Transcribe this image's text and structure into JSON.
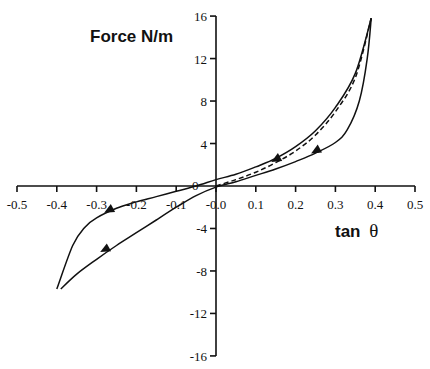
{
  "chart_data": {
    "type": "line",
    "title": "",
    "xlabel": "tan θ",
    "xlabel_parts": {
      "text": "tan",
      "symbol": "θ"
    },
    "ylabel": "Force N/m",
    "xlim": [
      -0.5,
      0.5
    ],
    "ylim": [
      -16,
      16
    ],
    "grid": false,
    "legend": null,
    "x_ticks": [
      -0.5,
      -0.4,
      -0.3,
      -0.2,
      -0.1,
      0.0,
      0.1,
      0.2,
      0.3,
      0.4,
      0.5
    ],
    "x_tick_labels": [
      "-0.5",
      "-0.4",
      "-0.3",
      "-0.2",
      "-0.1",
      "-0.0",
      "0.1",
      "0.2",
      "0.3",
      "0.4",
      "0.5"
    ],
    "y_ticks": [
      16,
      12,
      8,
      4,
      0,
      -4,
      -8,
      -12,
      -16
    ],
    "y_tick_labels": [
      "16",
      "12",
      "8",
      "4",
      "0",
      "-4",
      "-8",
      "-12",
      "-16"
    ],
    "series": [
      {
        "name": "loading (upper branch, solid)",
        "style": "solid",
        "direction_arrow": "down-left along branch toward origin",
        "x": [
          -0.4,
          -0.36,
          -0.33,
          -0.3,
          -0.25,
          -0.2,
          -0.15,
          -0.1,
          -0.05,
          0.0,
          0.05,
          0.1,
          0.15,
          0.2,
          0.25,
          0.3,
          0.35,
          0.39
        ],
        "y": [
          -9.7,
          -5.6,
          -3.9,
          -3.0,
          -2.1,
          -1.5,
          -1.0,
          -0.5,
          0.0,
          0.6,
          1.1,
          1.8,
          2.6,
          3.7,
          5.2,
          7.4,
          10.6,
          15.8
        ]
      },
      {
        "name": "unloading (lower branch, solid)",
        "style": "solid",
        "direction_arrow": "down-left (from peak toward minimum)",
        "x": [
          0.39,
          0.38,
          0.36,
          0.33,
          0.3,
          0.25,
          0.2,
          0.15,
          0.1,
          0.05,
          0.0,
          -0.05,
          -0.1,
          -0.15,
          -0.2,
          -0.25,
          -0.3,
          -0.35,
          -0.39
        ],
        "y": [
          15.8,
          12.0,
          8.0,
          5.3,
          4.1,
          3.1,
          2.3,
          1.6,
          1.0,
          0.4,
          -0.1,
          -0.9,
          -2.0,
          -3.2,
          -4.4,
          -5.6,
          -6.9,
          -8.3,
          -9.7
        ]
      },
      {
        "name": "dashed reference curve",
        "style": "dashed",
        "x": [
          0.0,
          0.05,
          0.1,
          0.15,
          0.2,
          0.25,
          0.3,
          0.35,
          0.39
        ],
        "y": [
          0.0,
          0.6,
          1.3,
          2.2,
          3.3,
          4.8,
          7.0,
          10.2,
          15.8
        ]
      }
    ],
    "annotations": [
      {
        "type": "arrow",
        "at": [
          0.15,
          2.5
        ],
        "direction": "down-left"
      },
      {
        "type": "arrow",
        "at": [
          0.25,
          3.3
        ],
        "direction": "down-left"
      },
      {
        "type": "arrow",
        "at": [
          -0.27,
          -2.3
        ],
        "direction": "down-left"
      },
      {
        "type": "arrow",
        "at": [
          -0.28,
          -6.0
        ],
        "direction": "down-left"
      },
      {
        "type": "text",
        "label": "0",
        "at": [
          -0.05,
          0.0
        ]
      }
    ]
  }
}
